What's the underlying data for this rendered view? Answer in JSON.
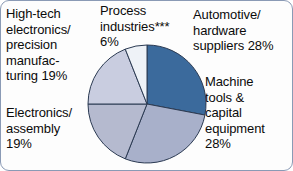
{
  "figure": {
    "background_color": "#fdfdfd",
    "border_color": "#8a9ab5"
  },
  "labels": {
    "hightech": "High-tech\nelectronics/\nprecision\nmanufac-\nturing 19%",
    "electronics": "Electronics/\nassembly\n19%",
    "process": "Process\nindustries***\n6%",
    "automotive": "Automotive/\nhardware\nsuppliers 28%",
    "machine": "Machine\ntools &\ncapital\nequipment\n28%"
  },
  "chart_data": {
    "type": "pie",
    "title": "",
    "xlabel": "",
    "ylabel": "",
    "legend_position": "callout-labels-around-pie",
    "grid": false,
    "start_angle_deg": 0,
    "direction": "clockwise",
    "center": [
      60,
      60
    ],
    "radius": 59,
    "slice_edge_color": "#2b3a52",
    "categories": [
      "Automotive/hardware suppliers",
      "Machine tools & capital equipment",
      "Electronics/assembly",
      "High-tech electronics/precision manufacturing",
      "Process industries***"
    ],
    "values": [
      28,
      28,
      19,
      19,
      6
    ],
    "value_labels": [
      "28%",
      "28%",
      "19%",
      "19%",
      "6%"
    ],
    "colors": [
      "#3b6a9c",
      "#a8b0ca",
      "#b5bacf",
      "#c9cde0",
      "#eef2f7"
    ],
    "footnote_marker": "***",
    "units": "percent"
  }
}
